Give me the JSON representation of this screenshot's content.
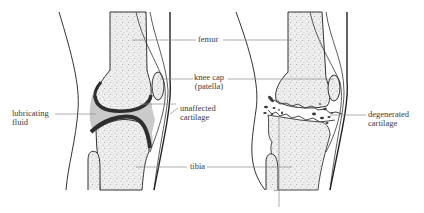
{
  "figure": {
    "colors": {
      "outline": "#333333",
      "cartilage": "#2e2e2e",
      "fluid": "#c8c8c8",
      "bone_fill": "#e6e6e6",
      "leader_line": "#8a8a8a",
      "text": "#3a3a3a"
    },
    "panels": [
      {
        "id": "healthy",
        "name": "Healthy knee"
      },
      {
        "id": "degenerated",
        "name": "Osteoarthritic knee"
      }
    ],
    "labels": {
      "femur": "femur",
      "knee_cap_line1": "knee cap",
      "knee_cap_line2": "(patella)",
      "unaffected_line1": "unaffected",
      "unaffected_line2": "cartilage",
      "lubricating_line1": "lubricating",
      "lubricating_line2": "fluid",
      "tibia": "tibia",
      "degenerated_line1": "degenerated",
      "degenerated_line2": "cartilage"
    }
  }
}
